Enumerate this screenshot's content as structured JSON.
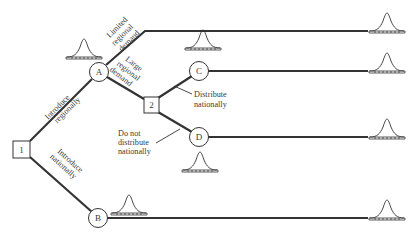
{
  "diagram": {
    "type": "decision-tree",
    "colors": {
      "line": "#333333",
      "text": "#3a3a3a",
      "background": "#ffffff"
    },
    "nodes": {
      "n1": {
        "label": "1",
        "shape": "square"
      },
      "nA": {
        "label": "A",
        "shape": "circle"
      },
      "n2": {
        "label": "2",
        "shape": "square"
      },
      "nB": {
        "label": "B",
        "shape": "circle"
      },
      "nC": {
        "label": "C",
        "shape": "circle"
      },
      "nD": {
        "label": "D",
        "shape": "circle"
      }
    },
    "edges": {
      "introduce_regionally": {
        "line1": "Introduce",
        "line2": "regionally"
      },
      "introduce_nationally": {
        "line1": "Introduce",
        "line2": "nationally"
      },
      "limited_regional_demand": {
        "line1": "Limited",
        "line2": "regional",
        "line3": "demand"
      },
      "large_regional_demand": {
        "line1": "Large",
        "line2": "regional",
        "line3": "demand"
      },
      "distribute_nationally": {
        "line1": "Distribute",
        "line2": "nationally"
      },
      "do_not_distribute": {
        "line1": "Do not",
        "line2": "distribute",
        "line3": "nationally"
      }
    },
    "distributions": [
      {
        "id": "dist-A",
        "shape": "bell-curve"
      },
      {
        "id": "dist-B",
        "shape": "bell-curve"
      },
      {
        "id": "dist-C",
        "shape": "bell-curve"
      },
      {
        "id": "dist-D",
        "shape": "bell-curve"
      },
      {
        "id": "outcome-1",
        "shape": "bell-curve"
      },
      {
        "id": "outcome-2",
        "shape": "bell-curve"
      },
      {
        "id": "outcome-3",
        "shape": "bell-curve"
      },
      {
        "id": "outcome-4",
        "shape": "bell-curve"
      }
    ]
  }
}
